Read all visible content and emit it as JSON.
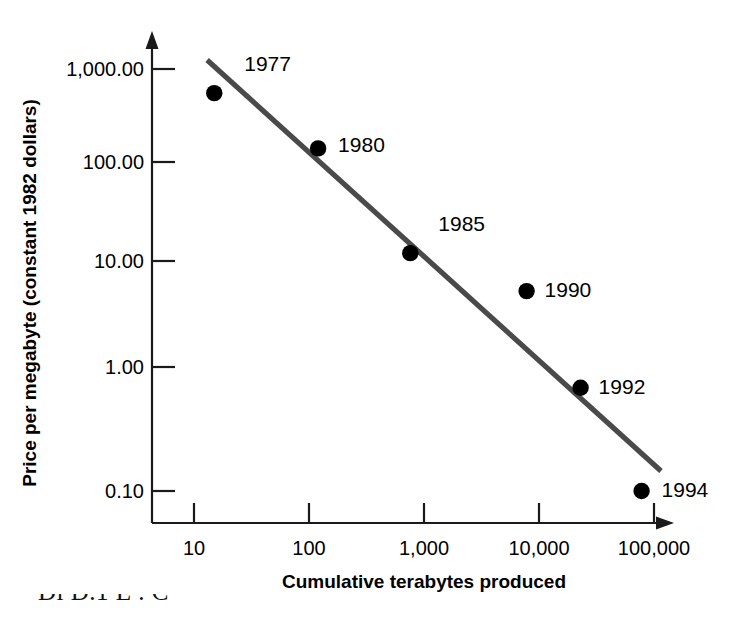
{
  "chart_data": {
    "type": "scatter",
    "title": "",
    "xlabel": "Cumulative terabytes produced",
    "ylabel": "Price per megabyte (constant 1982 dollars)",
    "xscale": "log",
    "yscale": "log",
    "xlim": [
      5,
      200000
    ],
    "ylim": [
      0.05,
      2000
    ],
    "grid": false,
    "legend": null,
    "x_tick_labels": [
      "10",
      "100",
      "1,000",
      "10,000",
      "100,000"
    ],
    "x_tick_values": [
      10,
      100,
      1000,
      10000,
      100000
    ],
    "y_tick_labels": [
      "1,000.00",
      "100.00",
      "10.00",
      "1.00",
      "0.10"
    ],
    "y_tick_values": [
      1000,
      100,
      10,
      1,
      0.1
    ],
    "points": [
      {
        "label": "1977",
        "x": 15,
        "y": 550,
        "label_dx": 30,
        "label_dy": -22
      },
      {
        "label": "1980",
        "x": 120,
        "y": 140,
        "label_dx": 20,
        "label_dy": 4
      },
      {
        "label": "1985",
        "x": 760,
        "y": 12,
        "label_dx": 28,
        "label_dy": -22
      },
      {
        "label": "1990",
        "x": 7800,
        "y": 5.2,
        "label_dx": 18,
        "label_dy": 6
      },
      {
        "label": "1992",
        "x": 23000,
        "y": 0.68,
        "label_dx": 18,
        "label_dy": 6
      },
      {
        "label": "1994",
        "x": 78000,
        "y": 0.1,
        "label_dx": 20,
        "label_dy": 6
      }
    ],
    "trend_line": {
      "name": "experience curve fit",
      "x_start": 13,
      "y_start": 1250,
      "x_end": 115000,
      "y_end": 0.145,
      "color": "#4a4a4a"
    },
    "annotations": []
  },
  "colors": {
    "axis": "#1a1a1a",
    "marker": "#000000",
    "trend": "#4a4a4a",
    "background": "#ffffff"
  },
  "caption_fragment": "Di   D.1    E         .    C"
}
